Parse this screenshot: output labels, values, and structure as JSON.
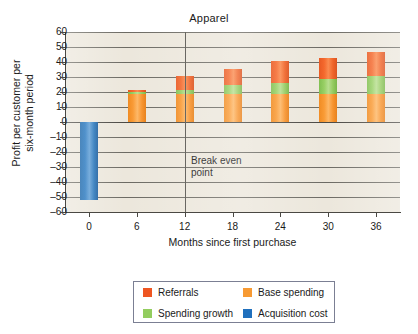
{
  "chart_data": {
    "type": "bar",
    "title": "Apparel",
    "xlabel": "Months since first purchase",
    "ylabel": "Profit per customer per six-month period",
    "ylabel_line1": "Profit per customer per",
    "ylabel_line2": "six-month period",
    "categories": [
      "0",
      "6",
      "12",
      "18",
      "24",
      "30",
      "36"
    ],
    "ylim": [
      -60,
      60
    ],
    "ytick_labels": [
      "60",
      "50",
      "40",
      "30",
      "20",
      "10",
      "0",
      "–10",
      "–20",
      "–30",
      "–40",
      "–50",
      "–60"
    ],
    "ytick_values": [
      60,
      50,
      40,
      30,
      20,
      10,
      0,
      -10,
      -20,
      -30,
      -40,
      -50,
      -60
    ],
    "grid": true,
    "stacked": true,
    "legend_position": "bottom",
    "series": [
      {
        "name": "Acquisition cost",
        "color": "#2375be",
        "values": [
          -52,
          0,
          0,
          0,
          0,
          0,
          0
        ]
      },
      {
        "name": "Base spending",
        "color": "#f99a34",
        "values": [
          0,
          18.5,
          19,
          19,
          19,
          19,
          19
        ]
      },
      {
        "name": "Spending growth",
        "color": "#97cf63",
        "values": [
          0,
          1.5,
          2.5,
          6,
          7,
          9.5,
          12
        ]
      },
      {
        "name": "Referrals",
        "color": "#f4682c",
        "values": [
          0,
          1.5,
          9,
          10.5,
          14.5,
          14.5,
          15.5
        ]
      }
    ],
    "totals": [
      -52,
      21.5,
      30.5,
      35.5,
      40.5,
      43,
      46.5
    ],
    "annotations": [
      {
        "name": "break-even",
        "line1": "Break even",
        "line2": "point",
        "x_value": 12
      }
    ]
  },
  "legend": {
    "items": [
      {
        "label": "Referrals",
        "color": "#ee5622"
      },
      {
        "label": "Base spending",
        "color": "#f79a33"
      },
      {
        "label": "Spending growth",
        "color": "#93cd5f"
      },
      {
        "label": "Acquisition cost",
        "color": "#2070bd"
      }
    ]
  }
}
